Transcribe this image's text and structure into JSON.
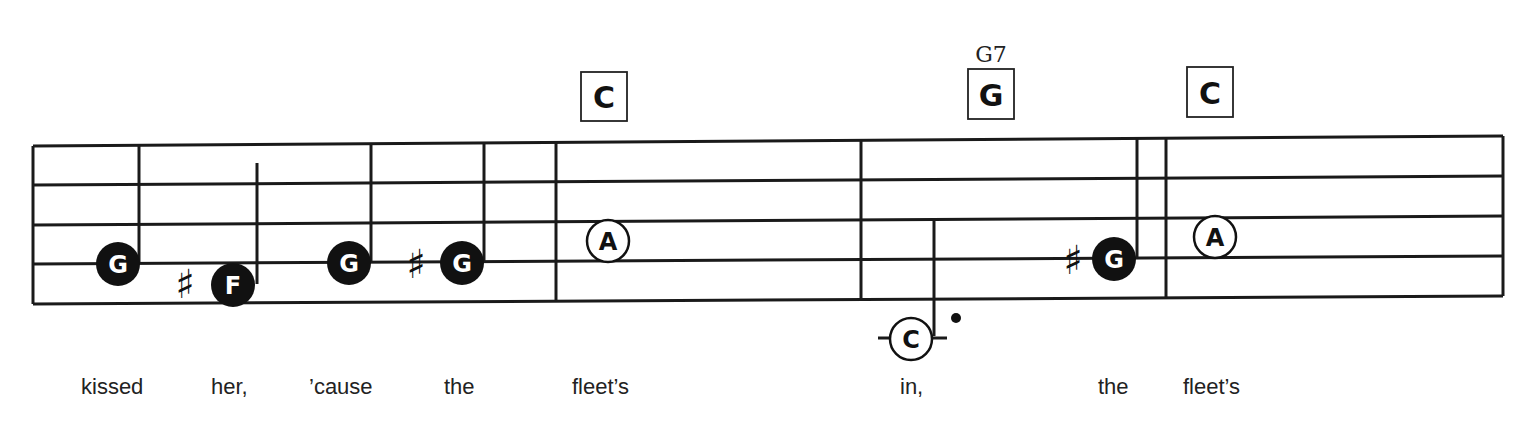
{
  "score": {
    "chords": [
      {
        "label": "C",
        "sub": "",
        "x": 582,
        "y": 72
      },
      {
        "label": "G",
        "sub": "G7",
        "x": 968,
        "y": 68
      },
      {
        "label": "C",
        "sub": "",
        "x": 1187,
        "y": 67
      }
    ],
    "notes": [
      {
        "letter": "G",
        "style": "filled",
        "sharp": false
      },
      {
        "letter": "F",
        "style": "filled",
        "sharp": true
      },
      {
        "letter": "G",
        "style": "filled",
        "sharp": false
      },
      {
        "letter": "G",
        "style": "filled",
        "sharp": true
      },
      {
        "letter": "A",
        "style": "open",
        "sharp": false
      },
      {
        "letter": "C",
        "style": "open",
        "sharp": false,
        "dotted": true,
        "ledger": true
      },
      {
        "letter": "G",
        "style": "filled",
        "sharp": true
      },
      {
        "letter": "A",
        "style": "open",
        "sharp": false
      }
    ],
    "sharp_symbol": "♯",
    "lyrics": [
      "kissed",
      "her,",
      "’cause",
      "the",
      "fleet’s",
      "in,",
      "the",
      "fleet’s"
    ]
  }
}
